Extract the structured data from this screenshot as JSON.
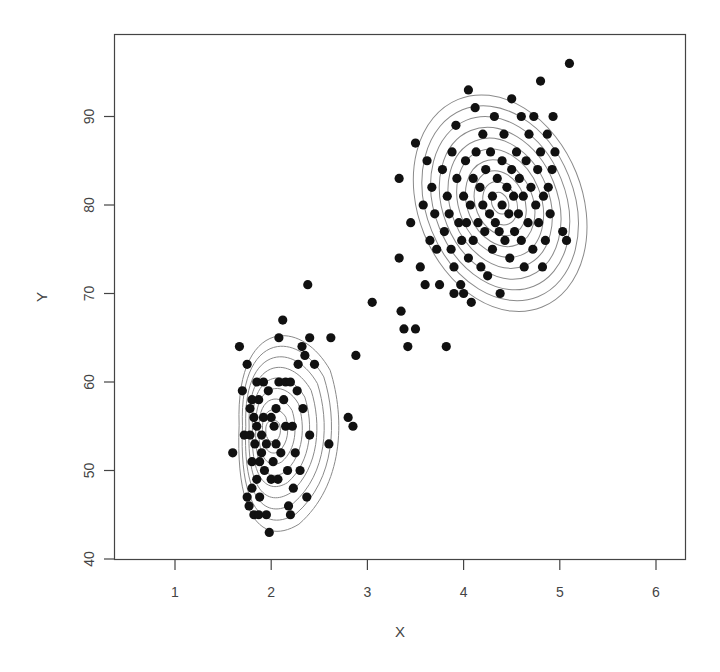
{
  "chart_data": {
    "type": "scatter",
    "title": "",
    "xlabel": "X",
    "ylabel": "Y",
    "xlim": [
      0.4,
      6.3
    ],
    "ylim": [
      39.8,
      98.5
    ],
    "x_ticks": [
      1,
      2,
      3,
      4,
      5,
      6
    ],
    "y_ticks": [
      40,
      50,
      60,
      70,
      80,
      90
    ],
    "grid": false,
    "legend": null,
    "overlay": "bivariate density contour lines (two clusters)",
    "series": [
      {
        "name": "points",
        "marker": "filled-circle",
        "color": "#111111",
        "points": [
          [
            1.6,
            52
          ],
          [
            1.67,
            64
          ],
          [
            1.7,
            59
          ],
          [
            1.72,
            54
          ],
          [
            1.75,
            62
          ],
          [
            1.75,
            47
          ],
          [
            1.77,
            46
          ],
          [
            1.78,
            57
          ],
          [
            1.78,
            54
          ],
          [
            1.8,
            58
          ],
          [
            1.8,
            48
          ],
          [
            1.8,
            51
          ],
          [
            1.82,
            56
          ],
          [
            1.82,
            45
          ],
          [
            1.83,
            53
          ],
          [
            1.85,
            60
          ],
          [
            1.85,
            49
          ],
          [
            1.85,
            55
          ],
          [
            1.87,
            58
          ],
          [
            1.87,
            45
          ],
          [
            1.88,
            51
          ],
          [
            1.88,
            47
          ],
          [
            1.9,
            52
          ],
          [
            1.9,
            54
          ],
          [
            1.92,
            56
          ],
          [
            1.92,
            60
          ],
          [
            1.93,
            50
          ],
          [
            1.95,
            45
          ],
          [
            1.95,
            53
          ],
          [
            1.97,
            59
          ],
          [
            1.98,
            43
          ],
          [
            2.0,
            49
          ],
          [
            2.0,
            56
          ],
          [
            2.02,
            51
          ],
          [
            2.03,
            55
          ],
          [
            2.05,
            53
          ],
          [
            2.05,
            57
          ],
          [
            2.07,
            49
          ],
          [
            2.08,
            65
          ],
          [
            2.08,
            60
          ],
          [
            2.1,
            52
          ],
          [
            2.12,
            67
          ],
          [
            2.13,
            58
          ],
          [
            2.15,
            55
          ],
          [
            2.15,
            60
          ],
          [
            2.17,
            50
          ],
          [
            2.18,
            46
          ],
          [
            2.2,
            60
          ],
          [
            2.2,
            45
          ],
          [
            2.22,
            55
          ],
          [
            2.23,
            48
          ],
          [
            2.25,
            52
          ],
          [
            2.27,
            59
          ],
          [
            2.28,
            62
          ],
          [
            2.3,
            50
          ],
          [
            2.32,
            64
          ],
          [
            2.33,
            57
          ],
          [
            2.35,
            63
          ],
          [
            2.37,
            47
          ],
          [
            2.38,
            71
          ],
          [
            2.4,
            54
          ],
          [
            2.4,
            65
          ],
          [
            2.45,
            62
          ],
          [
            2.6,
            53
          ],
          [
            2.62,
            65
          ],
          [
            2.8,
            56
          ],
          [
            2.85,
            55
          ],
          [
            2.88,
            63
          ],
          [
            3.05,
            69
          ],
          [
            3.33,
            83
          ],
          [
            3.33,
            74
          ],
          [
            3.35,
            68
          ],
          [
            3.38,
            66
          ],
          [
            3.42,
            64
          ],
          [
            3.45,
            78
          ],
          [
            3.5,
            66
          ],
          [
            3.5,
            87
          ],
          [
            3.55,
            73
          ],
          [
            3.58,
            80
          ],
          [
            3.6,
            71
          ],
          [
            3.62,
            85
          ],
          [
            3.65,
            76
          ],
          [
            3.67,
            82
          ],
          [
            3.7,
            79
          ],
          [
            3.72,
            75
          ],
          [
            3.75,
            71
          ],
          [
            3.78,
            84
          ],
          [
            3.8,
            77
          ],
          [
            3.82,
            64
          ],
          [
            3.83,
            81
          ],
          [
            3.85,
            79
          ],
          [
            3.87,
            75
          ],
          [
            3.88,
            86
          ],
          [
            3.9,
            73
          ],
          [
            3.9,
            70
          ],
          [
            3.92,
            89
          ],
          [
            3.93,
            83
          ],
          [
            3.95,
            78
          ],
          [
            3.97,
            71
          ],
          [
            3.98,
            76
          ],
          [
            4.0,
            81
          ],
          [
            4.0,
            70
          ],
          [
            4.02,
            85
          ],
          [
            4.03,
            78
          ],
          [
            4.05,
            93
          ],
          [
            4.05,
            74
          ],
          [
            4.07,
            80
          ],
          [
            4.08,
            69
          ],
          [
            4.1,
            83
          ],
          [
            4.1,
            76
          ],
          [
            4.12,
            91
          ],
          [
            4.13,
            86
          ],
          [
            4.15,
            78
          ],
          [
            4.17,
            82
          ],
          [
            4.18,
            73
          ],
          [
            4.2,
            88
          ],
          [
            4.2,
            80
          ],
          [
            4.22,
            77
          ],
          [
            4.23,
            84
          ],
          [
            4.25,
            72
          ],
          [
            4.27,
            79
          ],
          [
            4.28,
            86
          ],
          [
            4.3,
            81
          ],
          [
            4.3,
            75
          ],
          [
            4.32,
            90
          ],
          [
            4.33,
            78
          ],
          [
            4.35,
            83
          ],
          [
            4.37,
            77
          ],
          [
            4.38,
            70
          ],
          [
            4.4,
            85
          ],
          [
            4.4,
            80
          ],
          [
            4.42,
            88
          ],
          [
            4.43,
            76
          ],
          [
            4.45,
            82
          ],
          [
            4.47,
            79
          ],
          [
            4.48,
            74
          ],
          [
            4.5,
            92
          ],
          [
            4.5,
            84
          ],
          [
            4.52,
            81
          ],
          [
            4.53,
            77
          ],
          [
            4.55,
            86
          ],
          [
            4.57,
            79
          ],
          [
            4.58,
            83
          ],
          [
            4.6,
            76
          ],
          [
            4.6,
            90
          ],
          [
            4.62,
            81
          ],
          [
            4.63,
            73
          ],
          [
            4.65,
            85
          ],
          [
            4.67,
            78
          ],
          [
            4.68,
            88
          ],
          [
            4.7,
            82
          ],
          [
            4.72,
            75
          ],
          [
            4.73,
            90
          ],
          [
            4.75,
            80
          ],
          [
            4.77,
            84
          ],
          [
            4.78,
            78
          ],
          [
            4.8,
            94
          ],
          [
            4.8,
            86
          ],
          [
            4.82,
            73
          ],
          [
            4.83,
            81
          ],
          [
            4.85,
            76
          ],
          [
            4.87,
            88
          ],
          [
            4.88,
            82
          ],
          [
            4.9,
            79
          ],
          [
            4.92,
            84
          ],
          [
            4.93,
            90
          ],
          [
            4.95,
            86
          ],
          [
            5.03,
            77
          ],
          [
            5.07,
            76
          ],
          [
            5.1,
            96
          ]
        ]
      }
    ],
    "contours": [
      {
        "cluster": "lower-left",
        "center": [
          2.02,
          54.5
        ],
        "levels": 9,
        "outer_rx_px": 52,
        "outer_ry_px": 110
      },
      {
        "cluster": "upper-right",
        "center": [
          4.38,
          80.2
        ],
        "levels": 10,
        "outer_rx_px": 82,
        "outer_ry_px": 112,
        "tilt_deg": -22
      }
    ]
  }
}
